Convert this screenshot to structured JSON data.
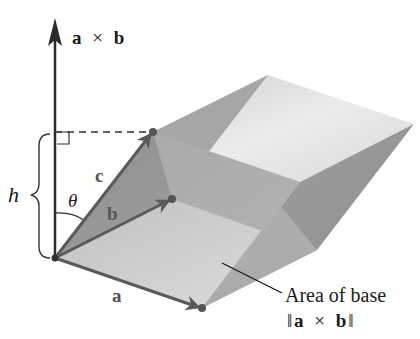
{
  "figure": {
    "type": "parallelepiped volume diagram",
    "labels": {
      "cross_product_axis": {
        "a": "a",
        "times": "×",
        "b": "b"
      },
      "vector_a": "a",
      "vector_b": "b",
      "vector_c": "c",
      "height": "h",
      "angle": "θ",
      "base_area_line1": "Area of base",
      "base_area_line2": {
        "open": "‖",
        "a": "a",
        "times": "×",
        "b": "b",
        "close": "‖"
      }
    },
    "colors": {
      "axis": "#333333",
      "vectors": "#5a5a5a",
      "face_top": "#e4e4e4",
      "face_front_light": "#c8c8c8",
      "face_front_dark": "#8f8f8f",
      "face_side": "#9a9a9a",
      "face_base": "#d2d2d2"
    }
  }
}
